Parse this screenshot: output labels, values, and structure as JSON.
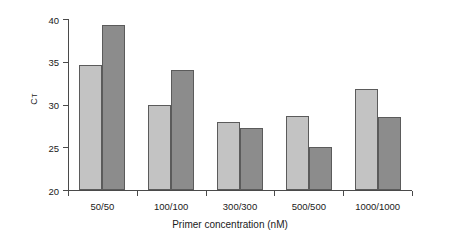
{
  "chart_data": {
    "type": "bar",
    "title": "",
    "xlabel": "Primer concentration (nM)",
    "ylabel": "CT",
    "ylabel_base": "C",
    "ylabel_sub": "T",
    "categories": [
      "50/50",
      "100/100",
      "300/300",
      "500/500",
      "1000/1000"
    ],
    "series": [
      {
        "name": "series-a",
        "color": "#c3c3c3",
        "values": [
          34.6,
          30.0,
          28.0,
          28.6,
          31.8
        ]
      },
      {
        "name": "series-b",
        "color": "#8c8c8c",
        "values": [
          39.3,
          34.0,
          27.3,
          25.0,
          28.5
        ]
      }
    ],
    "ylim": [
      20,
      40
    ],
    "yticks": [
      20,
      25,
      30,
      35,
      40
    ],
    "ytick_labels": [
      "20",
      "25",
      "30",
      "35",
      "40"
    ],
    "grid": false,
    "legend": "none",
    "axis_color": "#4a4a4a",
    "bar_edge_color": "#5b5b5b",
    "background": "#ffffff"
  }
}
